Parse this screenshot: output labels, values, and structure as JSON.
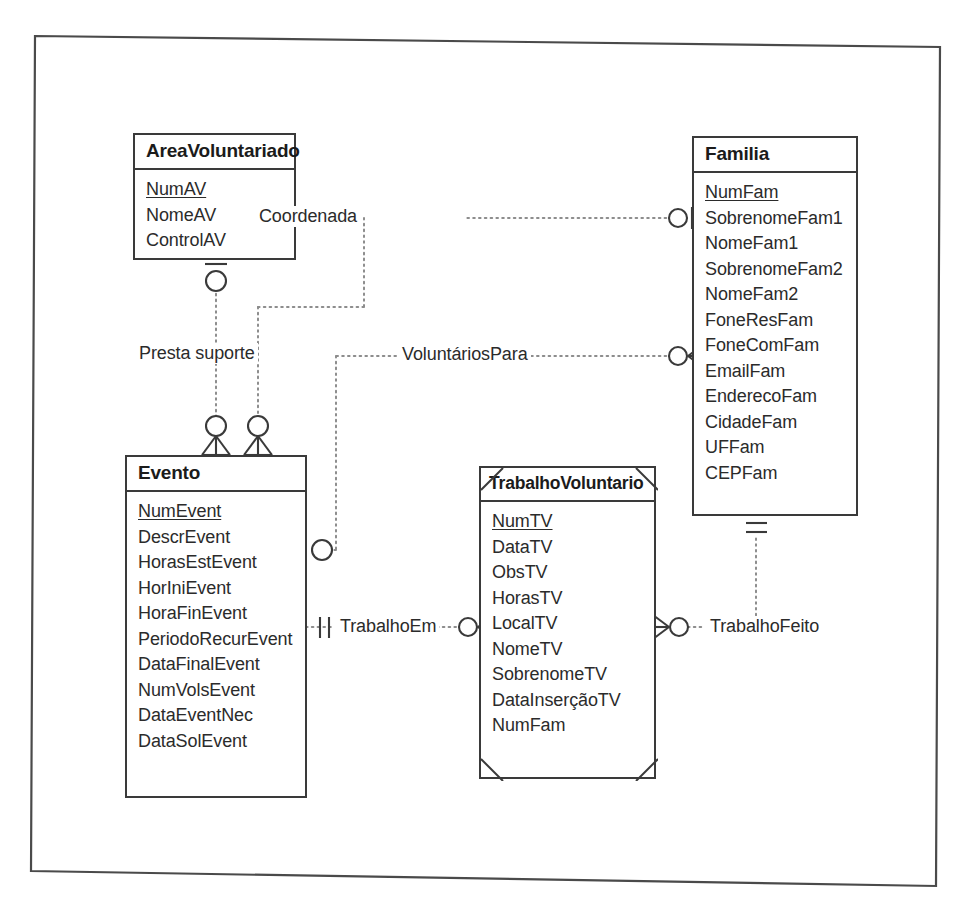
{
  "diagram": {
    "type": "entity-relationship-diagram",
    "notation": "crow's foot (IE / Information Engineering)",
    "entities": [
      {
        "id": "areavoluntariado",
        "name": "AreaVoluntariado",
        "weak": false,
        "attributes": [
          {
            "name": "NumAV",
            "key": true
          },
          {
            "name": "NomeAV",
            "key": false
          },
          {
            "name": "ControlAV",
            "key": false
          }
        ]
      },
      {
        "id": "familia",
        "name": "Familia",
        "weak": false,
        "attributes": [
          {
            "name": "NumFam",
            "key": true
          },
          {
            "name": "SobrenomeFam1",
            "key": false
          },
          {
            "name": "NomeFam1",
            "key": false
          },
          {
            "name": "SobrenomeFam2",
            "key": false
          },
          {
            "name": "NomeFam2",
            "key": false
          },
          {
            "name": "FoneResFam",
            "key": false
          },
          {
            "name": "FoneComFam",
            "key": false
          },
          {
            "name": "EmailFam",
            "key": false
          },
          {
            "name": "EnderecoFam",
            "key": false
          },
          {
            "name": "CidadeFam",
            "key": false
          },
          {
            "name": "UFFam",
            "key": false
          },
          {
            "name": "CEPFam",
            "key": false
          }
        ]
      },
      {
        "id": "evento",
        "name": "Evento",
        "weak": false,
        "attributes": [
          {
            "name": "NumEvent",
            "key": true
          },
          {
            "name": "DescrEvent",
            "key": false
          },
          {
            "name": "HorasEstEvent",
            "key": false
          },
          {
            "name": "HorIniEvent",
            "key": false
          },
          {
            "name": "HoraFinEvent",
            "key": false
          },
          {
            "name": "PeriodoRecurEvent",
            "key": false
          },
          {
            "name": "DataFinalEvent",
            "key": false
          },
          {
            "name": "NumVolsEvent",
            "key": false
          },
          {
            "name": "DataEventNec",
            "key": false
          },
          {
            "name": "DataSolEvent",
            "key": false
          }
        ]
      },
      {
        "id": "trabalhovoluntario",
        "name": "TrabalhoVoluntario",
        "weak": true,
        "attributes": [
          {
            "name": "NumTV",
            "key": true
          },
          {
            "name": "DataTV",
            "key": false
          },
          {
            "name": "ObsTV",
            "key": false
          },
          {
            "name": "HorasTV",
            "key": false
          },
          {
            "name": "LocalTV",
            "key": false
          },
          {
            "name": "NomeTV",
            "key": false
          },
          {
            "name": "SobrenomeTV",
            "key": false
          },
          {
            "name": "DataInserçãoTV",
            "key": false
          },
          {
            "name": "NumFam",
            "key": false
          }
        ]
      }
    ],
    "relationships": [
      {
        "id": "coordenada",
        "label": "Coordenada",
        "from": "evento",
        "to": "familia",
        "from_cardinality": "zero-or-many",
        "to_cardinality": "zero-or-one"
      },
      {
        "id": "presta-suporte",
        "label": "Presta suporte",
        "from": "areavoluntariado",
        "to": "evento",
        "from_cardinality": "zero-or-one",
        "to_cardinality": "zero-or-many"
      },
      {
        "id": "voluntariospara",
        "label": "VoluntáriosPara",
        "from": "evento",
        "to": "familia",
        "from_cardinality": "zero-or-one",
        "to_cardinality": "zero-or-many"
      },
      {
        "id": "trabalhoem",
        "label": "TrabalhoEm",
        "from": "evento",
        "to": "trabalhovoluntario",
        "from_cardinality": "exactly-one",
        "to_cardinality": "zero-or-many"
      },
      {
        "id": "trabalhofeito",
        "label": "TrabalhoFeito",
        "from": "trabalhovoluntario",
        "to": "familia",
        "from_cardinality": "zero-or-many",
        "to_cardinality": "exactly-one"
      }
    ]
  }
}
